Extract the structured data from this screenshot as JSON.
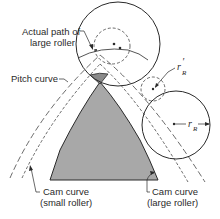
{
  "diagram": {
    "type": "cam-roller-follower",
    "colors": {
      "ink": "#2a2a2a",
      "cam_fill": "#a8a8a8",
      "cusp_fill": "#8a8a8a",
      "background": "#ffffff"
    },
    "labels": {
      "actual_path_line1": "Actual path of",
      "actual_path_line2": "large roller",
      "pitch_curve": "Pitch curve",
      "cam_small_line1": "Cam curve",
      "cam_small_line2": "(small roller)",
      "cam_large_line1": "Cam curve",
      "cam_large_line2": "(large roller)",
      "r_small_symbol": "r",
      "r_small_sub": "R",
      "r_small_prime": "′",
      "r_large_symbol": "r",
      "r_large_sub": "R"
    },
    "elements": {
      "large_roller_top": {
        "cx": 118,
        "cy": 44,
        "r": 42
      },
      "small_roller_top": {
        "cx": 112,
        "cy": 46,
        "r": 18
      },
      "small_roller_right": {
        "cx": 153,
        "cy": 89,
        "r": 12
      },
      "large_roller_right": {
        "cx": 176,
        "cy": 125,
        "r": 34
      }
    }
  }
}
